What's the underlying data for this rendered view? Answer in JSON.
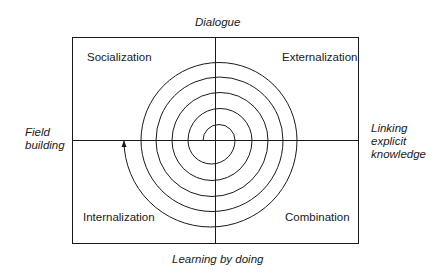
{
  "diagram": {
    "type": "knowledge-creation-spiral",
    "axes": {
      "top": "Dialogue",
      "bottom": "Learning by doing",
      "left": [
        "Field",
        "building"
      ],
      "right": [
        "Linking",
        "explicit",
        "knowledge"
      ]
    },
    "quadrants": {
      "top_left": "Socialization",
      "top_right": "Externalization",
      "bottom_left": "Internalization",
      "bottom_right": "Combination"
    },
    "colors": {
      "line": "#1a1a1a",
      "background": "#ffffff"
    }
  }
}
